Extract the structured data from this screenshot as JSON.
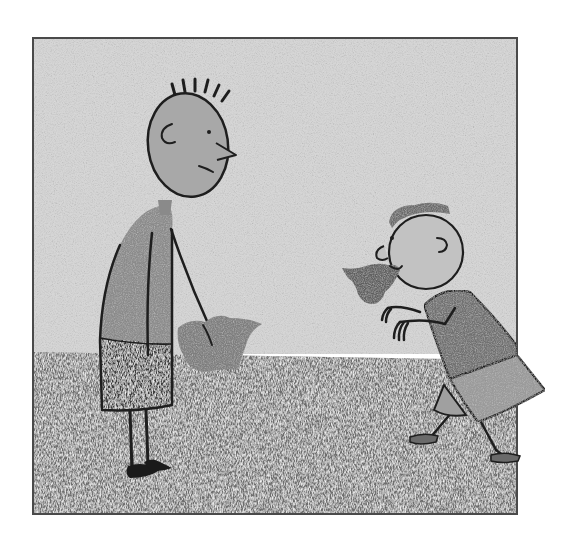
{
  "scene": {
    "description": "Grayscale crayon illustration: a tall spiky-haired boy stands holding a crumpled cloth while a smaller boy bends forward with a crumpled cloth in his mouth, arms raised like claws.",
    "style": "crayon drawing, grayscale",
    "frame": {
      "x": 32,
      "y": 37,
      "width": 486,
      "height": 478
    },
    "horizon_y": 352
  },
  "colors": {
    "page": "#ffffff",
    "frame_border": "#4a4a4a",
    "sky": "#d6d6d6",
    "sky_texture": "#c4c4c4",
    "ground": "#6e6e6e",
    "ground_texture": "#8c8c8c",
    "tall_boy_skin": "#a8a8a8",
    "tall_boy_shirt": "#8a8a8a",
    "tall_boy_shorts": "#3c3c3c",
    "cloth_held": "#7d7d7d",
    "small_boy_skin": "#c2c2c2",
    "small_boy_hair": "#6a6a6a",
    "small_boy_shirt": "#707070",
    "small_boy_skirt": "#9a9a9a",
    "cloth_mouth": "#5e5e5e",
    "ink": "#1e1e1e"
  },
  "characters": [
    {
      "id": "tall-boy",
      "label": "Tall boy with spiky hair holding a cloth"
    },
    {
      "id": "small-boy",
      "label": "Small boy carrying cloth in his mouth"
    }
  ]
}
